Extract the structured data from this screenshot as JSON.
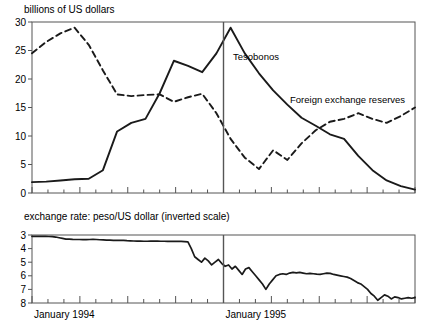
{
  "figure": {
    "top_panel": {
      "title": "billions of US dollars",
      "y_ticks": [
        0,
        5,
        10,
        15,
        20,
        25,
        30
      ],
      "ylim": [
        0,
        30
      ],
      "grid": false,
      "series_labels": {
        "tesobonos": "Tesobonos",
        "reserves": "Foreign exchange reserves"
      }
    },
    "bottom_panel": {
      "title": "exchange rate: peso/US dollar (inverted scale)",
      "y_ticks": [
        3,
        4,
        5,
        6,
        7,
        8
      ],
      "ylim": [
        3,
        8
      ],
      "inverted": true,
      "grid": false
    },
    "x_axis": {
      "tick_labels": [
        "January 1994",
        "January 1995"
      ],
      "tick_label_positions": [
        0,
        12
      ],
      "range_months": [
        0,
        24
      ]
    },
    "annotations": {
      "crisis_line_label": "December 1994 devaluation marker"
    },
    "colors": {
      "line": "#1a1a1a",
      "frame": "#555555",
      "background": "#ffffff",
      "marker": "#555555"
    }
  },
  "chart_data": [
    {
      "type": "line",
      "panel": "top",
      "title": "billions of US dollars",
      "xlabel": "",
      "ylabel": "billions of US dollars",
      "ylim": [
        0,
        30
      ],
      "xlim": [
        0,
        24
      ],
      "grid": false,
      "legend_position": "inline-annotations",
      "x": [
        0,
        1,
        2,
        3,
        4,
        5,
        6,
        7,
        8,
        9,
        10,
        11,
        12,
        13,
        14,
        15,
        16,
        17,
        18,
        19,
        20,
        21,
        22,
        23,
        24
      ],
      "x_labels": [
        "Jan 1994",
        "Feb 1994",
        "Mar 1994",
        "Apr 1994",
        "May 1994",
        "Jun 1994",
        "Jul 1994",
        "Aug 1994",
        "Sep 1994",
        "Oct 1994",
        "Nov 1994",
        "Dec 1994",
        "Jan 1995",
        "Feb 1995",
        "Mar 1995",
        "Apr 1995",
        "May 1995",
        "Jun 1995",
        "Jul 1995",
        "Aug 1995",
        "Sep 1995",
        "Oct 1995",
        "Nov 1995",
        "Dec 1995",
        "Jan 1996"
      ],
      "series": [
        {
          "name": "Tesobonos",
          "style": "solid",
          "values": [
            1.9,
            2.0,
            2.2,
            2.4,
            2.5,
            4.0,
            10.8,
            12.3,
            13.0,
            17.5,
            23.2,
            22.3,
            21.2,
            24.5,
            29.0,
            24.5,
            21.0,
            18.0,
            15.5,
            13.2,
            11.8,
            10.3,
            9.5,
            6.5,
            4.0,
            2.2,
            1.2,
            0.6
          ]
        },
        {
          "name": "Foreign exchange reserves",
          "style": "dashed",
          "values": [
            24.5,
            26.5,
            28.0,
            29.0,
            26.0,
            21.5,
            17.3,
            17.0,
            17.2,
            17.3,
            16.0,
            16.8,
            17.4,
            14.0,
            9.5,
            6.2,
            4.2,
            7.5,
            5.8,
            8.7,
            11.0,
            12.5,
            13.0,
            14.0,
            13.0,
            12.3,
            13.5,
            15.0
          ]
        }
      ]
    },
    {
      "type": "line",
      "panel": "bottom",
      "title": "exchange rate: peso/US dollar (inverted scale)",
      "xlabel": "",
      "ylabel": "peso/US dollar",
      "ylim": [
        3,
        8
      ],
      "y_inverted": true,
      "xlim": [
        0,
        24
      ],
      "grid": false,
      "series": [
        {
          "name": "peso/US dollar exchange rate",
          "style": "solid",
          "frequency": "daily",
          "values": [
            3.1,
            3.1,
            3.1,
            3.1,
            3.1,
            3.11,
            3.12,
            3.15,
            3.2,
            3.25,
            3.3,
            3.3,
            3.32,
            3.33,
            3.33,
            3.34,
            3.34,
            3.33,
            3.32,
            3.33,
            3.35,
            3.36,
            3.38,
            3.38,
            3.39,
            3.39,
            3.4,
            3.4,
            3.42,
            3.43,
            3.44,
            3.45,
            3.45,
            3.46,
            3.46,
            3.45,
            3.45,
            3.45,
            3.46,
            3.46,
            3.47,
            3.47,
            3.47,
            3.47,
            3.47,
            3.48,
            3.5,
            4.0,
            4.6,
            4.8,
            5.0,
            4.7,
            4.9,
            5.2,
            5.0,
            4.8,
            5.1,
            5.3,
            5.2,
            5.5,
            5.3,
            5.6,
            5.9,
            5.5,
            5.4,
            5.7,
            6.0,
            6.3,
            6.6,
            7.0,
            6.6,
            6.3,
            6.0,
            5.9,
            5.85,
            5.9,
            5.8,
            5.75,
            5.78,
            5.75,
            5.8,
            5.85,
            5.82,
            5.85,
            5.88,
            5.9,
            5.85,
            5.8,
            5.82,
            5.9,
            5.95,
            6.0,
            6.05,
            6.1,
            6.2,
            6.35,
            6.5,
            6.6,
            6.8,
            7.0,
            7.3,
            7.5,
            7.8,
            7.6,
            7.4,
            7.5,
            7.7,
            7.55,
            7.6,
            7.7,
            7.65,
            7.6,
            7.65,
            7.6
          ]
        }
      ]
    }
  ]
}
